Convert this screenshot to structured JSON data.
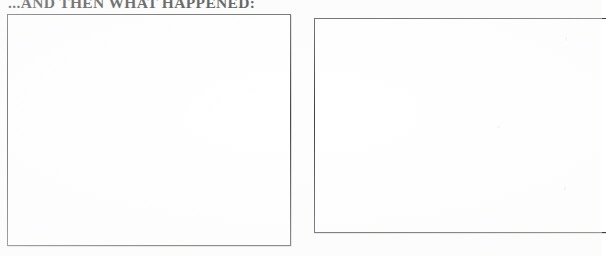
{
  "document": {
    "kind": "worksheet-scan",
    "heading": "...AND THEN WHAT HAPPENED:",
    "background_color": "#ffffff",
    "ink_color": "#1b1b1b"
  },
  "panels": [
    {
      "id": "panel-left",
      "label": "",
      "content": "",
      "border_color": "#454549",
      "fill_color": "#ffffff"
    },
    {
      "id": "panel-right",
      "label": "",
      "content": "",
      "border_color": "#3f3f43",
      "fill_color": "#ffffff"
    }
  ]
}
